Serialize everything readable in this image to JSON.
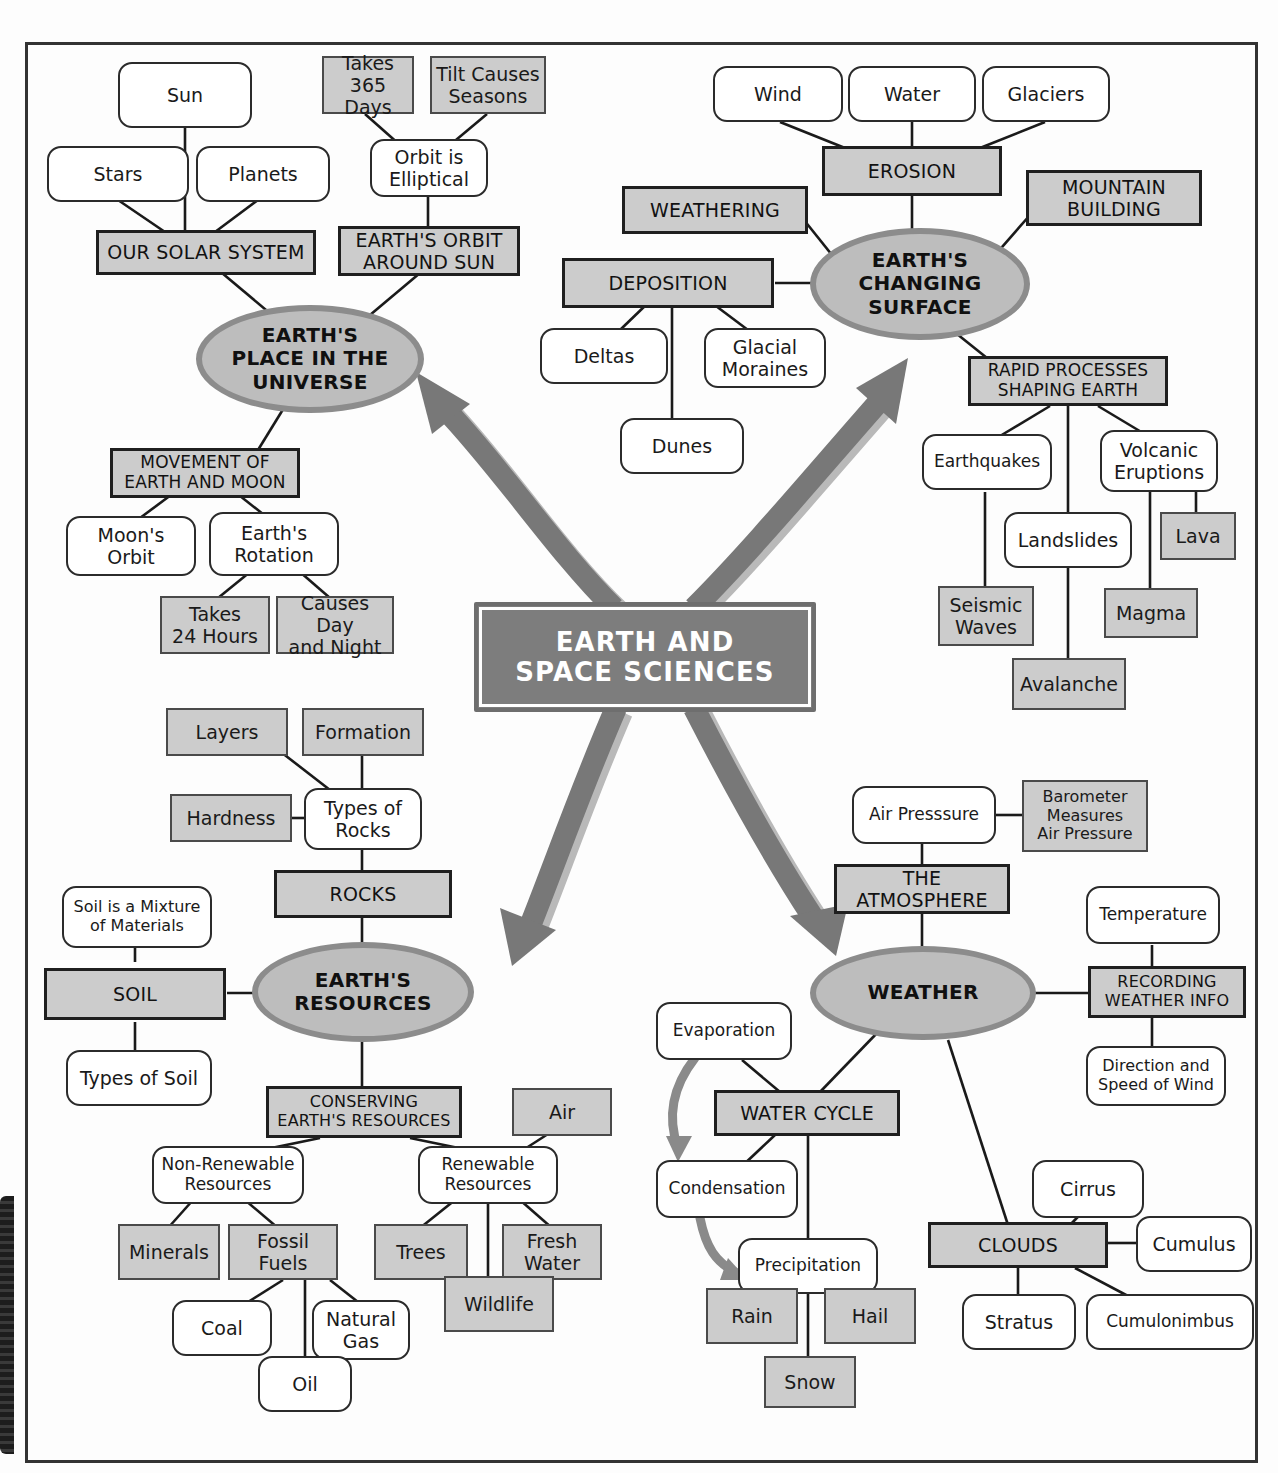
{
  "diagram": {
    "center": {
      "label": "EARTH AND\nSPACE SCIENCES",
      "line1": "EARTH AND",
      "line2": "SPACE SCIENCES"
    },
    "colors": {
      "gray_fill": "#cccccc",
      "ellipse_fill": "#bdbdbd",
      "ellipse_border": "#8c8c8c",
      "center_fill": "#7d7d7d",
      "arrow": "#787878",
      "arrow_shadow": "#b9b9b9",
      "line": "#1a1a1a",
      "white_fill": "#ffffff"
    },
    "branches": [
      {
        "id": "universe",
        "hub": "EARTH'S PLACE IN THE UNIVERSE"
      },
      {
        "id": "surface",
        "hub": "EARTH'S CHANGING SURFACE"
      },
      {
        "id": "resources",
        "hub": "EARTH'S RESOURCES"
      },
      {
        "id": "weather",
        "hub": "WEATHER"
      }
    ]
  },
  "nodes": {
    "sun": "Sun",
    "stars": "Stars",
    "planets": "Planets",
    "takes_365_days": "Takes\n365 Days",
    "takes_365_days_l1": "Takes",
    "takes_365_days_l2": "365 Days",
    "tilt_causes_seasons_l1": "Tilt Causes",
    "tilt_causes_seasons_l2": "Seasons",
    "orbit_elliptical_l1": "Orbit is",
    "orbit_elliptical_l2": "Elliptical",
    "our_solar_system": "OUR SOLAR SYSTEM",
    "earths_orbit_l1": "EARTH'S ORBIT",
    "earths_orbit_l2": "AROUND SUN",
    "hub_universe_l1": "EARTH'S",
    "hub_universe_l2": "PLACE IN THE",
    "hub_universe_l3": "UNIVERSE",
    "movement_l1": "MOVEMENT OF",
    "movement_l2": "EARTH AND MOON",
    "moons_orbit_l1": "Moon's",
    "moons_orbit_l2": "Orbit",
    "earths_rotation_l1": "Earth's",
    "earths_rotation_l2": "Rotation",
    "takes_24_l1": "Takes",
    "takes_24_l2": "24 Hours",
    "causes_day_l1": "Causes Day",
    "causes_day_l2": "and Night",
    "wind": "Wind",
    "water": "Water",
    "glaciers": "Glaciers",
    "erosion": "EROSION",
    "weathering": "WEATHERING",
    "mountain_building_l1": "MOUNTAIN",
    "mountain_building_l2": "BUILDING",
    "deposition": "DEPOSITION",
    "deltas": "Deltas",
    "glacial_moraines_l1": "Glacial",
    "glacial_moraines_l2": "Moraines",
    "dunes": "Dunes",
    "hub_surface_l1": "EARTH'S",
    "hub_surface_l2": "CHANGING",
    "hub_surface_l3": "SURFACE",
    "rapid_l1": "RAPID PROCESSES",
    "rapid_l2": "SHAPING EARTH",
    "earthquakes": "Earthquakes",
    "volcanic_l1": "Volcanic",
    "volcanic_l2": "Eruptions",
    "landslides": "Landslides",
    "lava": "Lava",
    "seismic_l1": "Seismic",
    "seismic_l2": "Waves",
    "magma": "Magma",
    "avalanche": "Avalanche",
    "layers": "Layers",
    "formation": "Formation",
    "hardness": "Hardness",
    "types_of_rocks_l1": "Types of",
    "types_of_rocks_l2": "Rocks",
    "rocks": "ROCKS",
    "soil_mixture_l1": "Soil is a Mixture",
    "soil_mixture_l2": "of Materials",
    "soil": "SOIL",
    "types_of_soil": "Types of Soil",
    "hub_resources_l1": "EARTH'S",
    "hub_resources_l2": "RESOURCES",
    "conserving_l1": "CONSERVING",
    "conserving_l2": "EARTH'S RESOURCES",
    "non_renewable_l1": "Non-Renewable",
    "non_renewable_l2": "Resources",
    "renewable_l1": "Renewable",
    "renewable_l2": "Resources",
    "air": "Air",
    "minerals": "Minerals",
    "fossil_fuels_l1": "Fossil",
    "fossil_fuels_l2": "Fuels",
    "trees": "Trees",
    "fresh_water_l1": "Fresh",
    "fresh_water_l2": "Water",
    "coal": "Coal",
    "natural_gas_l1": "Natural",
    "natural_gas_l2": "Gas",
    "wildlife": "Wildlife",
    "oil": "Oil",
    "air_pressure": "Air Presssure",
    "barometer_l1": "Barometer",
    "barometer_l2": "Measures",
    "barometer_l3": "Air Pressure",
    "the_atmosphere_l1": "THE",
    "the_atmosphere_l2": "ATMOSPHERE",
    "hub_weather": "WEATHER",
    "temperature": "Temperature",
    "recording_l1": "RECORDING",
    "recording_l2": "WEATHER INFO",
    "direction_speed_l1": "Direction and",
    "direction_speed_l2": "Speed of Wind",
    "evaporation": "Evaporation",
    "water_cycle": "WATER CYCLE",
    "condensation": "Condensation",
    "precipitation": "Precipitation",
    "rain": "Rain",
    "hail": "Hail",
    "snow": "Snow",
    "clouds": "CLOUDS",
    "cirrus": "Cirrus",
    "cumulus": "Cumulus",
    "stratus": "Stratus",
    "cumulonimbus": "Cumulonimbus"
  }
}
